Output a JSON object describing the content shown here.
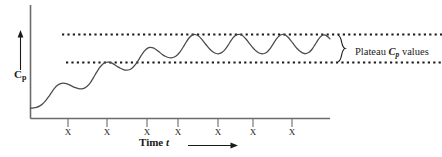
{
  "figure": {
    "kind": "pharmacokinetic-multiple-dose-curve",
    "background": "#ffffff",
    "ink": "#1a1a1a"
  },
  "axes": {
    "y_label_main": "C",
    "y_label_sub": "p",
    "x_label_main": "Time",
    "x_label_italic": "t",
    "y_arrow_icon": "up-arrow-icon",
    "x_arrow_icon": "right-arrow-icon"
  },
  "annotation": {
    "brace_icon": "curly-brace-icon",
    "text_before": "Plateau ",
    "text_italic": "C",
    "text_sub": "p",
    "text_after": " values"
  },
  "dose_marks": {
    "glyph": "X",
    "count": 7,
    "positions_px": [
      68,
      107,
      147,
      178,
      218,
      253,
      292
    ]
  },
  "chart_data": {
    "type": "line",
    "title": "",
    "xlabel": "Time t",
    "ylabel": "Cp",
    "grid": false,
    "legend_position": "right",
    "annotations": [
      {
        "label": "Plateau Cp values",
        "type": "brace",
        "spans": [
          "Cp_min_ss",
          "Cp_max_ss"
        ]
      }
    ],
    "reference_lines": [
      {
        "name": "Cp_max_ss",
        "label": "upper plateau",
        "value": 1.0,
        "style": "dotted"
      },
      {
        "name": "Cp_min_ss",
        "label": "lower plateau",
        "value": 0.62,
        "style": "dotted"
      }
    ],
    "dose_times": [
      0.13,
      0.26,
      0.39,
      0.49,
      0.63,
      0.74,
      0.87
    ],
    "dose_marker": "X",
    "xlim": [
      0,
      1.0
    ],
    "ylim": [
      0,
      1.25
    ],
    "series": [
      {
        "name": "Plasma concentration",
        "x": [
          0.0,
          0.01,
          0.02,
          0.03,
          0.04,
          0.05,
          0.06,
          0.07,
          0.08,
          0.09,
          0.1,
          0.11,
          0.12,
          0.13,
          0.14,
          0.15,
          0.16,
          0.17,
          0.18,
          0.19,
          0.2,
          0.21,
          0.22,
          0.23,
          0.24,
          0.25,
          0.26,
          0.27,
          0.28,
          0.29,
          0.3,
          0.31,
          0.32,
          0.33,
          0.34,
          0.35,
          0.36,
          0.37,
          0.38,
          0.39,
          0.4,
          0.41,
          0.42,
          0.43,
          0.44,
          0.45,
          0.46,
          0.47,
          0.48,
          0.49,
          0.5,
          0.51,
          0.52,
          0.53,
          0.54,
          0.55,
          0.56,
          0.57,
          0.58,
          0.59,
          0.6,
          0.61,
          0.62,
          0.63,
          0.64,
          0.65,
          0.66,
          0.67,
          0.68,
          0.69,
          0.7,
          0.71,
          0.72,
          0.73,
          0.74,
          0.75,
          0.76,
          0.77,
          0.78,
          0.79,
          0.8,
          0.81,
          0.82,
          0.83,
          0.84,
          0.85,
          0.86,
          0.87,
          0.88,
          0.89,
          0.9,
          0.91,
          0.92,
          0.93,
          0.94,
          0.95,
          0.96,
          0.97,
          0.98,
          0.99,
          1.0
        ],
        "y": [
          0.0,
          0.004,
          0.012,
          0.028,
          0.056,
          0.098,
          0.152,
          0.212,
          0.268,
          0.31,
          0.334,
          0.34,
          0.332,
          0.316,
          0.296,
          0.278,
          0.266,
          0.262,
          0.272,
          0.3,
          0.348,
          0.412,
          0.482,
          0.546,
          0.594,
          0.62,
          0.626,
          0.614,
          0.592,
          0.566,
          0.542,
          0.524,
          0.516,
          0.522,
          0.546,
          0.59,
          0.65,
          0.716,
          0.774,
          0.812,
          0.826,
          0.818,
          0.794,
          0.762,
          0.73,
          0.704,
          0.688,
          0.684,
          0.694,
          0.722,
          0.768,
          0.83,
          0.898,
          0.956,
          0.992,
          1.0,
          0.982,
          0.944,
          0.894,
          0.842,
          0.796,
          0.762,
          0.742,
          0.74,
          0.758,
          0.798,
          0.856,
          0.92,
          0.972,
          0.998,
          1.0,
          0.978,
          0.936,
          0.884,
          0.832,
          0.788,
          0.756,
          0.74,
          0.742,
          0.764,
          0.808,
          0.87,
          0.934,
          0.98,
          1.0,
          0.994,
          0.962,
          0.914,
          0.86,
          0.81,
          0.772,
          0.748,
          0.742,
          0.758,
          0.8,
          0.862,
          0.928,
          0.976,
          0.994,
          0.978,
          0.94
        ]
      }
    ]
  }
}
